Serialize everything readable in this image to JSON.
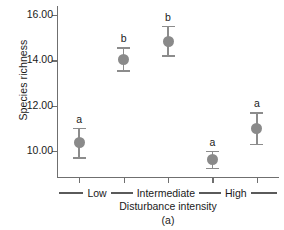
{
  "chart_data": {
    "type": "scatter",
    "title": "",
    "panel_label": "(a)",
    "xlabel": "Disturbance intensity",
    "ylabel": "Species richness",
    "ylim": [
      8.8,
      16.4
    ],
    "yticks": [
      10.0,
      12.0,
      14.0,
      16.0
    ],
    "ytick_labels": [
      "10.00",
      "12.00",
      "14.00",
      "16.00"
    ],
    "grid": false,
    "legend": "none",
    "marker_color": "#8a8a8a",
    "errorbar_color": "#8c8c8c",
    "axis_color": "#6f6f6f",
    "x_positions": [
      1,
      2,
      3,
      4,
      5
    ],
    "x_groups": [
      {
        "label": "Low",
        "ticks": [
          1
        ]
      },
      {
        "label": "Intermediate",
        "ticks": [
          2,
          3
        ]
      },
      {
        "label": "High",
        "ticks": [
          4,
          5
        ]
      }
    ],
    "points": [
      {
        "x": 1,
        "value": 10.35,
        "err_low": 0.7,
        "err_high": 0.68,
        "letter": "a"
      },
      {
        "x": 2,
        "value": 14.05,
        "err_low": 0.55,
        "err_high": 0.52,
        "letter": "b"
      },
      {
        "x": 3,
        "value": 14.85,
        "err_low": 0.7,
        "err_high": 0.68,
        "letter": "b"
      },
      {
        "x": 4,
        "value": 9.6,
        "err_low": 0.42,
        "err_high": 0.4,
        "letter": "a"
      },
      {
        "x": 5,
        "value": 11.0,
        "err_low": 0.75,
        "err_high": 0.72,
        "letter": "a"
      }
    ]
  }
}
